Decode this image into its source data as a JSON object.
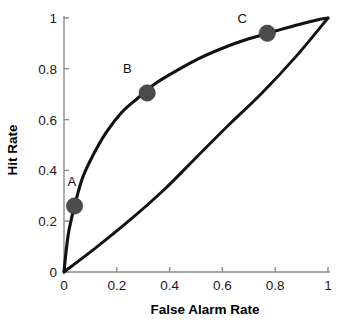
{
  "chart_data": {
    "type": "line",
    "title": "",
    "xlabel": "False Alarm Rate",
    "ylabel": "Hit Rate",
    "xlim": [
      0,
      1
    ],
    "ylim": [
      0,
      1
    ],
    "grid": false,
    "legend": "none",
    "x_ticks": [
      "0",
      "0.2",
      "0.4",
      "0.6",
      "0.8",
      "1"
    ],
    "x_tick_values": [
      0,
      0.2,
      0.4,
      0.6,
      0.8,
      1
    ],
    "y_ticks": [
      "0",
      "0.2",
      "0.4",
      "0.6",
      "0.8",
      "1"
    ],
    "y_tick_values": [
      0,
      0.2,
      0.4,
      0.6,
      0.8,
      1
    ],
    "series": [
      {
        "name": "ROC curve",
        "style": "solid-black-thick",
        "x": [
          0,
          0.01,
          0.02,
          0.04,
          0.07,
          0.11,
          0.16,
          0.22,
          0.28,
          0.35,
          0.43,
          0.52,
          0.61,
          0.7,
          0.78,
          0.86,
          0.93,
          0.97,
          1.0
        ],
        "y": [
          0,
          0.1,
          0.17,
          0.26,
          0.37,
          0.46,
          0.55,
          0.63,
          0.685,
          0.745,
          0.795,
          0.845,
          0.885,
          0.918,
          0.943,
          0.966,
          0.985,
          0.995,
          1.0
        ]
      },
      {
        "name": "Chance line",
        "style": "solid-black-thin",
        "x": [
          0,
          0.12,
          0.25,
          0.38,
          0.5,
          0.62,
          0.75,
          0.88,
          1.0
        ],
        "y": [
          0,
          0.095,
          0.205,
          0.325,
          0.45,
          0.575,
          0.705,
          0.85,
          1.0
        ]
      }
    ],
    "points": [
      {
        "label": "A",
        "x": 0.04,
        "y": 0.26,
        "label_dx": -0.01,
        "label_dy": 0.095
      },
      {
        "label": "B",
        "x": 0.315,
        "y": 0.705,
        "label_dx": -0.075,
        "label_dy": 0.095
      },
      {
        "label": "C",
        "x": 0.77,
        "y": 0.94,
        "label_dx": -0.095,
        "label_dy": 0.055
      }
    ],
    "marker_color": "#4b4b4b",
    "curve_color": "#111111",
    "axis_color": "#8a8a8a",
    "background_color": "#ffffff"
  }
}
